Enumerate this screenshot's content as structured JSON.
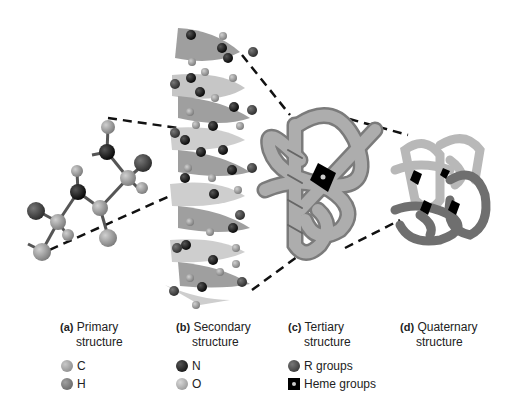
{
  "figure": {
    "panels": [
      {
        "letter": "(a)",
        "line1": "Primary",
        "line2": "structure"
      },
      {
        "letter": "(b)",
        "line1": "Secondary",
        "line2": "structure"
      },
      {
        "letter": "(c)",
        "line1": "Tertiary",
        "line2": "structure"
      },
      {
        "letter": "(d)",
        "line1": "Quaternary",
        "line2": "structure"
      }
    ],
    "legend": [
      {
        "label": "C",
        "icon": "carbon-atom-icon",
        "color": "#8a8a8a"
      },
      {
        "label": "H",
        "icon": "hydrogen-atom-icon",
        "color": "#6e6e6e"
      },
      {
        "label": "N",
        "icon": "nitrogen-atom-icon",
        "color": "#111111"
      },
      {
        "label": "O",
        "icon": "oxygen-atom-icon",
        "color": "#9a9a9a"
      },
      {
        "label": "R groups",
        "icon": "r-group-icon",
        "color": "#444444"
      },
      {
        "label": "Heme groups",
        "icon": "heme-group-icon",
        "color": "#000000"
      }
    ]
  }
}
